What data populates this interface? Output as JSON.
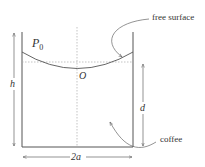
{
  "diagram": {
    "labels": {
      "p0_main": "P",
      "p0_sub": "0",
      "origin": "O",
      "height": "h",
      "depth": "d",
      "width": "2a",
      "free_surface": "free surface",
      "coffee": "coffee"
    },
    "colors": {
      "line": "#555555",
      "dashed": "#999999",
      "text": "#333333"
    }
  }
}
